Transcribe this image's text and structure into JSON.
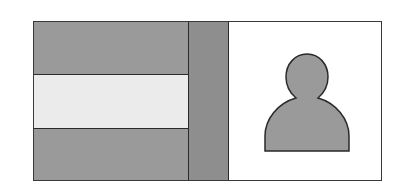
{
  "diagram": {
    "left_panel": {
      "bands": [
        {
          "name": "top-band",
          "fill": "#9a9a9a"
        },
        {
          "name": "middle-band",
          "fill": "#ebebeb"
        },
        {
          "name": "bottom-band",
          "fill": "#9a9a9a"
        }
      ]
    },
    "middle_strip": {
      "fill": "#8e8e8e"
    },
    "right_panel": {
      "fill": "#ffffff",
      "icon": "person-silhouette-icon",
      "icon_fill": "#9a9a9a"
    },
    "colors": {
      "border": "#2a2a2a",
      "dark_gray": "#9a9a9a",
      "light_gray": "#ebebeb",
      "strip_gray": "#8e8e8e"
    }
  }
}
